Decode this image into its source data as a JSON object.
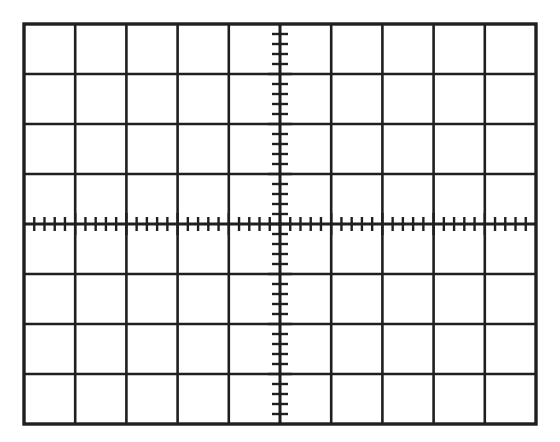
{
  "figure": {
    "kind": "oscilloscope-graticule",
    "background_color": "#ffffff",
    "line_color": "#1f1f1f"
  },
  "chart_data": {
    "type": "scatter",
    "title": "",
    "subtitle": "",
    "xlabel": "",
    "ylabel": "",
    "grid": true,
    "legend_position": "none",
    "annotations": [],
    "series": [
      {
        "name": "trace",
        "x": [],
        "y": []
      }
    ],
    "x": [],
    "values": [],
    "categories": [],
    "xlim": [
      -5,
      5
    ],
    "ylim": [
      -4,
      4
    ],
    "graticule": {
      "horizontal_divisions": 10,
      "vertical_divisions": 8,
      "subdivisions_per_division": 5,
      "center_axes": true,
      "x_tick_labels": [
        "-5",
        "-4",
        "-3",
        "-2",
        "-1",
        "0",
        "1",
        "2",
        "3",
        "4",
        "5"
      ],
      "y_tick_labels": [
        "4",
        "3",
        "2",
        "1",
        "0",
        "-1",
        "-2",
        "-3",
        "-4"
      ]
    },
    "geometry": {
      "left": 24,
      "top": 24,
      "right": 536,
      "bottom": 424,
      "cell_width": 51.2,
      "cell_height": 50,
      "center_x": 280,
      "center_y": 224,
      "minor_tick_length_x": 7,
      "minor_tick_length_y": 8,
      "major_tick_length_x": 11,
      "major_tick_length_y": 12
    }
  }
}
